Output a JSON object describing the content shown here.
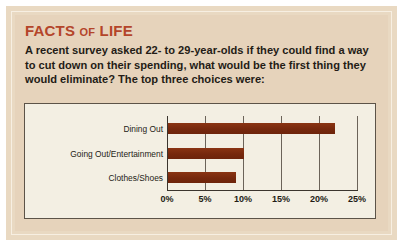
{
  "card": {
    "title_main_1": "FACTS ",
    "title_small": "OF",
    "title_main_2": " LIFE",
    "body": "A recent survey asked 22- to 29-year-olds if they could find a way to cut down on their spending, what would be the first thing they would eliminate? The top three choices were:"
  },
  "colors": {
    "title": "#b4452a",
    "bar": "#7d2c10",
    "card_bg": "#e6d3bb",
    "panel_bg": "#f3efe3",
    "frame": "#e9d9c2"
  },
  "chart_data": {
    "type": "bar",
    "orientation": "horizontal",
    "title": "",
    "xlabel": "",
    "ylabel": "",
    "categories": [
      "Dining Out",
      "Going Out/Entertainment",
      "Clothes/Shoes"
    ],
    "values": [
      22,
      10,
      9
    ],
    "xlim": [
      0,
      25
    ],
    "ticks": [
      0,
      5,
      10,
      15,
      20,
      25
    ],
    "tick_labels": [
      "0%",
      "5%",
      "10%",
      "15%",
      "20%",
      "25%"
    ],
    "grid": true,
    "legend": null
  }
}
